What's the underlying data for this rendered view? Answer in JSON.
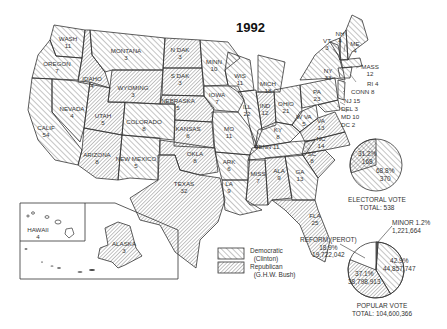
{
  "title": "1992",
  "legend": {
    "democratic": {
      "label": "Democratic",
      "sub": "(Clinton)"
    },
    "republican": {
      "label": "Republican",
      "sub": "(G.H.W. Bush)"
    }
  },
  "states": {
    "wash": {
      "name": "WASH",
      "ev": "11",
      "party": "D"
    },
    "oregon": {
      "name": "OREGON",
      "ev": "7",
      "party": "D"
    },
    "calif": {
      "name": "CALIF",
      "ev": "54",
      "party": "D"
    },
    "nevada": {
      "name": "NEVADA",
      "ev": "4",
      "party": "D"
    },
    "idaho": {
      "name": "IDAHO",
      "ev": "4",
      "party": "R"
    },
    "montana": {
      "name": "MONTANA",
      "ev": "3",
      "party": "D"
    },
    "wyoming": {
      "name": "WYOMING",
      "ev": "3",
      "party": "R"
    },
    "utah": {
      "name": "UTAH",
      "ev": "5",
      "party": "R"
    },
    "colorado": {
      "name": "COLORADO",
      "ev": "8",
      "party": "D"
    },
    "arizona": {
      "name": "ARIZONA",
      "ev": "8",
      "party": "R"
    },
    "newmexico": {
      "name": "NEW MEXICO",
      "ev": "5",
      "party": "D"
    },
    "ndak": {
      "name": "N DAK",
      "ev": "3",
      "party": "R"
    },
    "sdak": {
      "name": "S DAK",
      "ev": "3",
      "party": "R"
    },
    "nebraska": {
      "name": "NEBRASKA",
      "ev": "5",
      "party": "R"
    },
    "kansas": {
      "name": "KANSAS",
      "ev": "6",
      "party": "R"
    },
    "okla": {
      "name": "OKLA",
      "ev": "8",
      "party": "R"
    },
    "texas": {
      "name": "TEXAS",
      "ev": "32",
      "party": "R"
    },
    "minn": {
      "name": "MINN",
      "ev": "10",
      "party": "D"
    },
    "iowa": {
      "name": "IOWA",
      "ev": "7",
      "party": "D"
    },
    "mo": {
      "name": "MO",
      "ev": "11",
      "party": "D"
    },
    "ark": {
      "name": "ARK",
      "ev": "6",
      "party": "D"
    },
    "la": {
      "name": "LA",
      "ev": "9",
      "party": "D"
    },
    "wis": {
      "name": "WIS",
      "ev": "11",
      "party": "D"
    },
    "ill": {
      "name": "ILL",
      "ev": "22",
      "party": "D"
    },
    "mich": {
      "name": "MICH",
      "ev": "18",
      "party": "D"
    },
    "ind": {
      "name": "IND",
      "ev": "12",
      "party": "R"
    },
    "ohio": {
      "name": "OHIO",
      "ev": "21",
      "party": "D"
    },
    "ky": {
      "name": "KY",
      "ev": "8",
      "party": "D"
    },
    "tenn": {
      "name": "TENN",
      "ev": "11",
      "party": "D"
    },
    "miss": {
      "name": "MISS",
      "ev": "7",
      "party": "R"
    },
    "ala": {
      "name": "ALA",
      "ev": "9",
      "party": "R"
    },
    "ga": {
      "name": "GA",
      "ev": "13",
      "party": "D"
    },
    "fla": {
      "name": "FLA",
      "ev": "25",
      "party": "R"
    },
    "sc": {
      "name": "SC",
      "ev": "8",
      "party": "R"
    },
    "nc": {
      "name": "NC",
      "ev": "14",
      "party": "R"
    },
    "va": {
      "name": "VA",
      "ev": "13",
      "party": "R"
    },
    "wva": {
      "name": "W VA",
      "ev": "5",
      "party": "D"
    },
    "pa": {
      "name": "PA",
      "ev": "23",
      "party": "D"
    },
    "ny": {
      "name": "NY",
      "ev": "33",
      "party": "D"
    },
    "vt": {
      "name": "VT",
      "ev": "3",
      "party": "D"
    },
    "nh": {
      "name": "NH",
      "ev": "4",
      "party": "D"
    },
    "me": {
      "name": "ME",
      "ev": "4",
      "party": "D"
    },
    "mass": {
      "name": "MASS",
      "ev": "12",
      "party": "D"
    },
    "ri": {
      "name": "RI 4",
      "party": "D"
    },
    "conn": {
      "name": "CONN 8",
      "party": "D"
    },
    "nj": {
      "name": "NJ 15",
      "party": "D"
    },
    "del": {
      "name": "DEL 3",
      "party": "D"
    },
    "md": {
      "name": "MD 10",
      "party": "D"
    },
    "dc": {
      "name": "DC 2",
      "party": "D"
    },
    "hawaii": {
      "name": "HAWAII",
      "ev": "4",
      "party": "D"
    },
    "alaska": {
      "name": "ALASKA",
      "ev": "3",
      "party": "R"
    }
  },
  "electoral_pie": {
    "slices": [
      {
        "party": "Republican",
        "pct": "31.2%",
        "votes": "168"
      },
      {
        "party": "Democratic",
        "pct": "68.8%",
        "votes": "370"
      }
    ],
    "caption": "ELECTORAL VOTE",
    "total": "TOTAL: 538"
  },
  "popular_pie": {
    "slices": [
      {
        "party": "Minor",
        "label": "MINOR 1.2%",
        "votes": "1,221,664"
      },
      {
        "party": "Democratic",
        "pct": "42.9%",
        "votes": "44,857,747"
      },
      {
        "party": "Republican",
        "pct": "37.1%",
        "votes": "38,798,913"
      },
      {
        "party": "Reform (Perot)",
        "label": "REFORM (PEROT)",
        "pct": "18.9%",
        "votes": "19,722,042"
      }
    ],
    "caption": "POPULAR VOTE",
    "total": "TOTAL: 104,600,366"
  }
}
